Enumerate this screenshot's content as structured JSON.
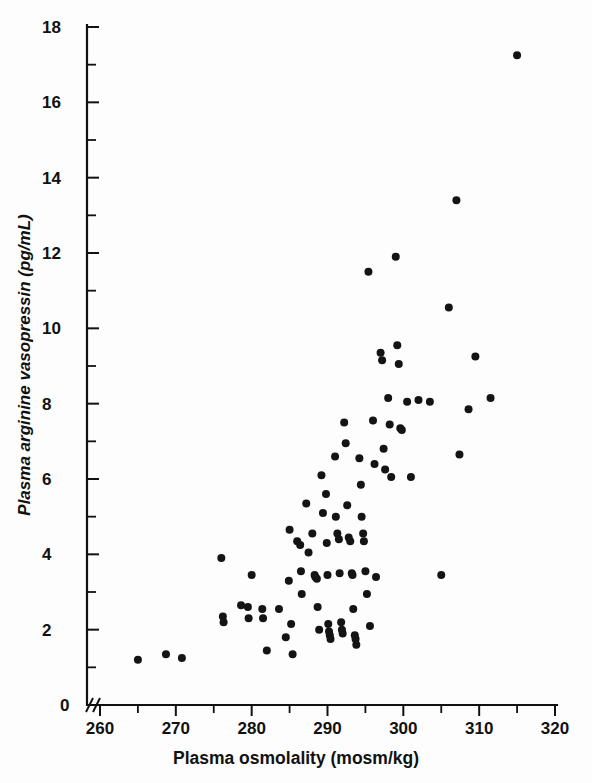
{
  "figure": {
    "background_color": "#fdfdfd",
    "point_color": "#141414",
    "axis_color": "#111111"
  },
  "axes": {
    "x_title": "Plasma osmolality (mosm/kg)",
    "y_title": "Plasma arginine vasopressin (pg/mL)",
    "x_ticks": [
      "260",
      "270",
      "280",
      "290",
      "300",
      "310",
      "320"
    ],
    "y_ticks": [
      "0",
      "2",
      "4",
      "6",
      "8",
      "10",
      "12",
      "14",
      "16",
      "18"
    ],
    "x_origin_label": "0",
    "axis_break": "//"
  },
  "chart_data": {
    "type": "scatter",
    "title": "",
    "xlabel": "Plasma osmolality (mosm/kg)",
    "ylabel": "Plasma arginine vasopressin (pg/mL)",
    "xlim": [
      258,
      320
    ],
    "ylim": [
      0,
      18
    ],
    "x_ticks": [
      260,
      270,
      280,
      290,
      300,
      310,
      320
    ],
    "y_ticks": [
      0,
      2,
      4,
      6,
      8,
      10,
      12,
      14,
      16,
      18
    ],
    "x_minor_ticks": [
      265,
      275,
      285,
      295,
      305,
      315
    ],
    "y_minor_ticks": [
      1,
      3,
      5,
      7,
      9,
      11,
      13,
      15,
      17
    ],
    "grid": false,
    "legend": null,
    "axis_break_on_x": true,
    "marker": "filled-circle",
    "marker_size_px": 8,
    "series": [
      {
        "name": "subjects",
        "points": [
          [
            265.0,
            1.2
          ],
          [
            268.7,
            1.35
          ],
          [
            270.8,
            1.25
          ],
          [
            276.0,
            3.9
          ],
          [
            276.2,
            2.35
          ],
          [
            276.3,
            2.2
          ],
          [
            278.6,
            2.65
          ],
          [
            279.5,
            2.6
          ],
          [
            279.6,
            2.3
          ],
          [
            280.0,
            3.45
          ],
          [
            281.4,
            2.55
          ],
          [
            281.5,
            2.3
          ],
          [
            282.0,
            1.45
          ],
          [
            283.6,
            2.55
          ],
          [
            284.5,
            1.8
          ],
          [
            284.9,
            3.3
          ],
          [
            285.0,
            4.65
          ],
          [
            285.2,
            2.15
          ],
          [
            285.4,
            1.35
          ],
          [
            286.0,
            4.35
          ],
          [
            286.4,
            4.25
          ],
          [
            286.5,
            3.55
          ],
          [
            286.6,
            2.95
          ],
          [
            287.2,
            5.35
          ],
          [
            287.5,
            4.05
          ],
          [
            288.0,
            4.55
          ],
          [
            288.3,
            3.45
          ],
          [
            288.4,
            3.4
          ],
          [
            288.6,
            3.35
          ],
          [
            288.7,
            2.6
          ],
          [
            288.9,
            2.0
          ],
          [
            289.2,
            6.1
          ],
          [
            289.4,
            5.1
          ],
          [
            289.8,
            5.6
          ],
          [
            289.9,
            4.3
          ],
          [
            290.0,
            3.45
          ],
          [
            290.1,
            2.15
          ],
          [
            290.2,
            1.95
          ],
          [
            290.3,
            1.85
          ],
          [
            290.4,
            1.75
          ],
          [
            291.0,
            6.6
          ],
          [
            291.1,
            5.0
          ],
          [
            291.3,
            4.55
          ],
          [
            291.5,
            4.4
          ],
          [
            291.6,
            3.5
          ],
          [
            291.8,
            2.2
          ],
          [
            291.9,
            2.0
          ],
          [
            292.0,
            1.9
          ],
          [
            292.2,
            7.5
          ],
          [
            292.4,
            6.95
          ],
          [
            292.6,
            5.3
          ],
          [
            292.8,
            4.45
          ],
          [
            293.0,
            4.35
          ],
          [
            293.2,
            3.5
          ],
          [
            293.3,
            3.45
          ],
          [
            293.4,
            2.55
          ],
          [
            293.6,
            1.85
          ],
          [
            293.7,
            1.75
          ],
          [
            293.8,
            1.6
          ],
          [
            294.2,
            6.55
          ],
          [
            294.4,
            5.85
          ],
          [
            294.5,
            5.0
          ],
          [
            294.7,
            4.55
          ],
          [
            294.8,
            4.35
          ],
          [
            295.0,
            3.55
          ],
          [
            295.2,
            2.95
          ],
          [
            295.4,
            11.5
          ],
          [
            295.6,
            2.1
          ],
          [
            296.0,
            7.55
          ],
          [
            296.2,
            6.4
          ],
          [
            296.4,
            3.4
          ],
          [
            297.0,
            9.35
          ],
          [
            297.2,
            9.15
          ],
          [
            297.4,
            6.8
          ],
          [
            297.6,
            6.25
          ],
          [
            298.0,
            8.15
          ],
          [
            298.2,
            7.45
          ],
          [
            298.4,
            6.05
          ],
          [
            299.0,
            11.9
          ],
          [
            299.2,
            9.55
          ],
          [
            299.4,
            9.05
          ],
          [
            299.6,
            7.35
          ],
          [
            299.8,
            7.3
          ],
          [
            300.5,
            8.05
          ],
          [
            301.0,
            6.05
          ],
          [
            302.0,
            8.1
          ],
          [
            303.5,
            8.05
          ],
          [
            305.0,
            3.45
          ],
          [
            306.0,
            10.55
          ],
          [
            307.0,
            13.4
          ],
          [
            307.4,
            6.65
          ],
          [
            308.6,
            7.85
          ],
          [
            309.5,
            9.25
          ],
          [
            311.5,
            8.15
          ],
          [
            315.0,
            17.25
          ]
        ]
      }
    ]
  }
}
